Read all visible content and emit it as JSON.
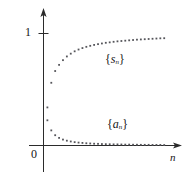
{
  "figure": {
    "background_color": "#ffffff",
    "ink_color": "#222222",
    "dot_color": "#55555a"
  },
  "axes": {
    "y_axis_name": "vertical-axis",
    "x_axis_name": "horizontal-axis",
    "x_axis_label": "n",
    "origin_label": "0",
    "y_tick_label": "1",
    "y_tick_value": 1,
    "arrowheads": "both-axes-arrow-tipped"
  },
  "series_labels": {
    "sn_open": "{",
    "sn_letter": "s",
    "sn_sub": "n",
    "sn_close": "}",
    "an_open": "{",
    "an_letter": "a",
    "an_sub": "n",
    "an_close": "}"
  },
  "chart_data": {
    "type": "scatter",
    "title": "",
    "subtitle": "",
    "xlabel": "n",
    "ylabel": "",
    "grid": false,
    "legend_position": "inline-annotation",
    "xlim": [
      0,
      33
    ],
    "ylim": [
      0,
      1.18
    ],
    "xticks": [],
    "xticklabels": [],
    "yticks": [
      1
    ],
    "yticklabels": [
      "1"
    ],
    "annotations": [
      {
        "text": "{s_n}",
        "x": 14.5,
        "y": 0.78
      },
      {
        "text": "{a_n}",
        "x": 15.0,
        "y": 0.2
      }
    ],
    "x": [
      1,
      2,
      3,
      4,
      5,
      6,
      7,
      8,
      9,
      10,
      11,
      12,
      13,
      14,
      15,
      16,
      17,
      18,
      19,
      20,
      21,
      22,
      23,
      24,
      25,
      26,
      27,
      28,
      29,
      30,
      31
    ],
    "series": [
      {
        "name": "{s_n}",
        "description": "partial sums converging to 1",
        "values": [
          0.34,
          0.56,
          0.665,
          0.72,
          0.762,
          0.795,
          0.82,
          0.841,
          0.857,
          0.87,
          0.881,
          0.89,
          0.898,
          0.905,
          0.911,
          0.917,
          0.921,
          0.926,
          0.93,
          0.933,
          0.936,
          0.939,
          0.942,
          0.945,
          0.947,
          0.949,
          0.951,
          0.953,
          0.955,
          0.957,
          0.958
        ],
        "limit": 1
      },
      {
        "name": "{a_n}",
        "description": "terms decaying to 0",
        "values": [
          0.225,
          0.135,
          0.092,
          0.068,
          0.053,
          0.043,
          0.036,
          0.03,
          0.026,
          0.023,
          0.02,
          0.018,
          0.016,
          0.015,
          0.013,
          0.012,
          0.011,
          0.01,
          0.01,
          0.009,
          0.008,
          0.008,
          0.007,
          0.007,
          0.006,
          0.006,
          0.006,
          0.005,
          0.005,
          0.005,
          0.004
        ],
        "limit": 0
      }
    ]
  }
}
